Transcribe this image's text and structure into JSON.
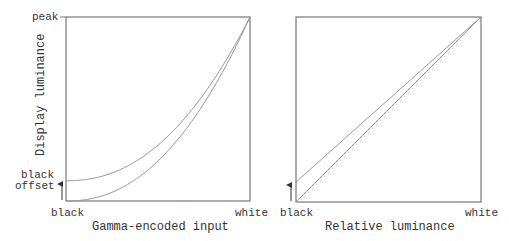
{
  "chart_data": [
    {
      "type": "line",
      "title": "",
      "xlabel": "Gamma-encoded input",
      "ylabel": "Display luminance",
      "x_ticks": [
        "black",
        "white"
      ],
      "y_ticks": [
        "black offset",
        "peak"
      ],
      "annotations": [
        "black offset"
      ],
      "grid": false,
      "series": [
        {
          "name": "gamma curve",
          "x": [
            0,
            0.25,
            0.5,
            0.75,
            1
          ],
          "y": [
            0,
            0.05,
            0.22,
            0.53,
            1
          ]
        },
        {
          "name": "gamma curve with black offset",
          "x": [
            0,
            0.25,
            0.5,
            0.75,
            1
          ],
          "y": [
            0.11,
            0.15,
            0.3,
            0.58,
            1
          ]
        }
      ]
    },
    {
      "type": "line",
      "title": "",
      "xlabel": "Relative luminance",
      "ylabel": "",
      "x_ticks": [
        "black",
        "white"
      ],
      "grid": false,
      "series": [
        {
          "name": "linear",
          "x": [
            0,
            1
          ],
          "y": [
            0,
            1
          ]
        },
        {
          "name": "linear with black offset",
          "x": [
            0,
            1
          ],
          "y": [
            0.11,
            1
          ]
        }
      ]
    }
  ],
  "left": {
    "ylabel": "Display luminance",
    "peak": "peak",
    "offset_line1": "black",
    "offset_line2": "offset",
    "x_min": "black",
    "x_max": "white",
    "xlabel": "Gamma-encoded input"
  },
  "right": {
    "x_min": "black",
    "x_max": "white",
    "xlabel": "Relative luminance"
  },
  "colors": {
    "line": "#888888",
    "frame": "#777777",
    "text": "#333333"
  }
}
